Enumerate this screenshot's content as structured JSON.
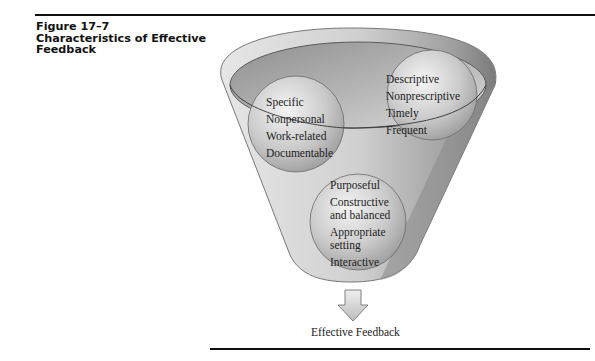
{
  "figure": {
    "number": "Figure 17–7",
    "title_line1": "Characteristics of Effective",
    "title_line2": "Feedback"
  },
  "diagram": {
    "type": "funnel",
    "circles": [
      {
        "name": "left",
        "items": [
          "Specific",
          "Nonpersonal",
          "Work-related",
          "Documentable"
        ]
      },
      {
        "name": "right",
        "items": [
          "Descriptive",
          "Nonprescriptive",
          "Timely",
          "Frequent"
        ]
      },
      {
        "name": "bottom",
        "items": [
          "Purposeful",
          "Constructive",
          "and balanced",
          "Appropriate",
          "setting",
          "Interactive"
        ]
      }
    ],
    "output_label": "Effective Feedback",
    "colors": {
      "funnel_outer": "#bdbdbd",
      "funnel_inner": "#9a9a9a",
      "circle": "#cfcfcf",
      "rule": "#111111"
    }
  }
}
